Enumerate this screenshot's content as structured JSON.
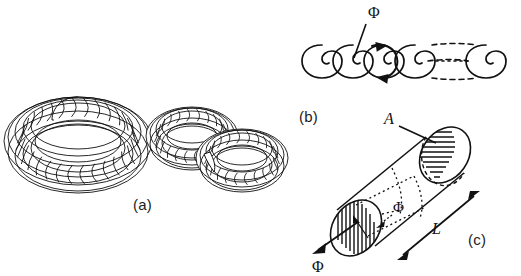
{
  "figure": {
    "type": "scientific-line-diagram",
    "background_color": "#ffffff",
    "ink_color": "#111111",
    "panels": [
      {
        "id": "a",
        "label": "(a)",
        "description": "wireframe torus and a pair of interlinked wireframe tori (Hopf link)",
        "objects": [
          "single-torus",
          "linked-torus-pair"
        ]
      },
      {
        "id": "b",
        "label": "(b)",
        "description": "chain of interlocking flux rings with circulation arrows and a dashed continuation segment",
        "annotations": [
          "flux-symbol"
        ]
      },
      {
        "id": "c",
        "label": "(c)",
        "description": "tilted cylindrical flux tube with hatched elliptical end caps, cross-sectional area and length annotated",
        "annotations": [
          "area-symbol",
          "length-symbol",
          "flux-symbol-interior",
          "flux-symbol-exterior"
        ]
      }
    ]
  },
  "labels": {
    "panel_a": "(a)",
    "panel_b": "(b)",
    "panel_c": "(c)",
    "flux_b": "Φ",
    "flux_c_interior": "Φ",
    "flux_c_exterior": "Φ",
    "area": "A",
    "length": "L"
  },
  "colors": {
    "ink": "#111111",
    "label_ink": "#1b1b1b",
    "paper": "#ffffff",
    "mesh_shade": "#c9c9c9"
  },
  "icons": {
    "flux": "greek-capital-phi",
    "area": "italic-a",
    "length": "italic-l"
  }
}
